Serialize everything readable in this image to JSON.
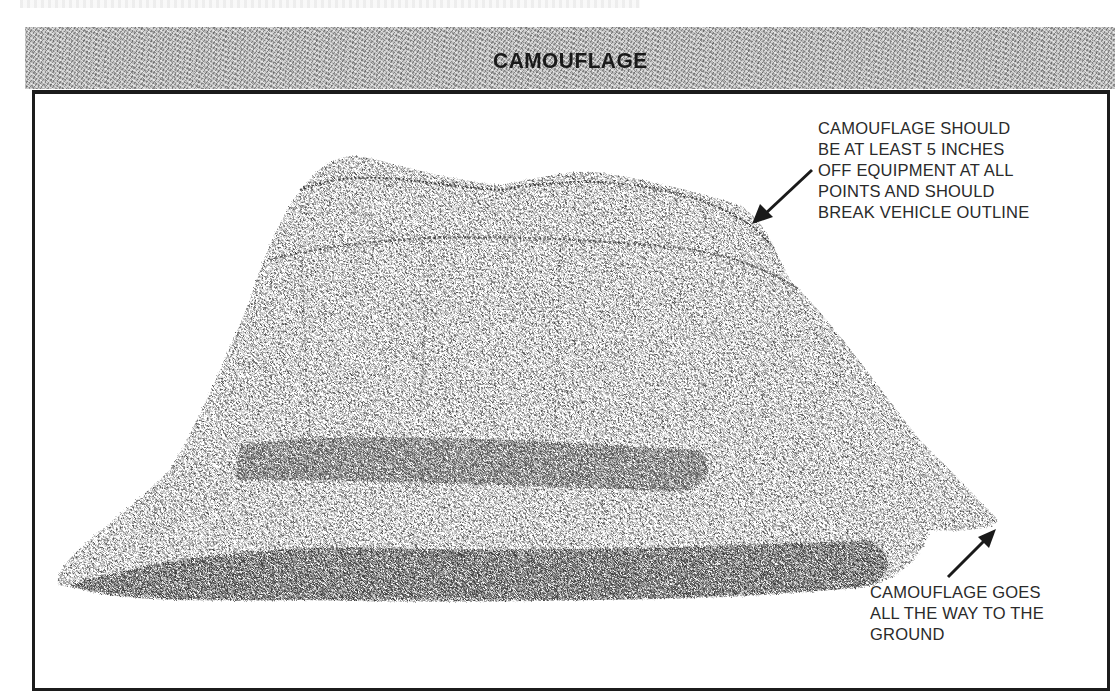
{
  "header": {
    "title": "CAMOUFLAGE"
  },
  "illustration": {
    "subject": "camouflage-netted vehicle mound",
    "ink_color": "#1a1a1a",
    "band_color": "#b8b8b8",
    "frame_color": "#1c1c1c"
  },
  "callouts": {
    "top": {
      "lines": [
        "CAMOUFLAGE SHOULD",
        "BE AT LEAST 5 INCHES",
        "OFF EQUIPMENT AT ALL",
        "POINTS AND SHOULD",
        "BREAK VEHICLE OUTLINE"
      ]
    },
    "bottom": {
      "lines": [
        "CAMOUFLAGE GOES",
        "ALL THE WAY TO THE",
        "GROUND"
      ]
    }
  }
}
